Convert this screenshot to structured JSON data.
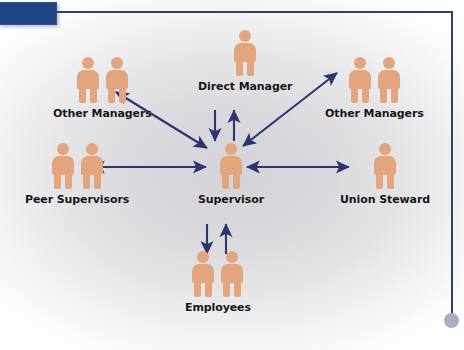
{
  "slide": {
    "title_accent_color": "#1f4585",
    "rule_color": "#2b4170",
    "dot_color": "#a9aec4",
    "figure_color": "#e3a57d",
    "arrow_color": "#2b3570",
    "background_center": "#d4d4d8",
    "background_edge": "#ffffff"
  },
  "diagram": {
    "type": "hub-and-spoke communication network",
    "center_node": "supervisor",
    "nodes": [
      {
        "id": "direct-manager",
        "label": "Direct Manager",
        "figure_count": 1,
        "position": "top-center"
      },
      {
        "id": "other-managers-left",
        "label": "Other Managers",
        "figure_count": 2,
        "position": "top-left"
      },
      {
        "id": "other-managers-right",
        "label": "Other Managers",
        "figure_count": 2,
        "position": "top-right"
      },
      {
        "id": "peer-supervisors",
        "label": "Peer Supervisors",
        "figure_count": 2,
        "position": "middle-left"
      },
      {
        "id": "supervisor",
        "label": "Supervisor",
        "figure_count": 1,
        "position": "center"
      },
      {
        "id": "union-steward",
        "label": "Union Steward",
        "figure_count": 1,
        "position": "middle-right"
      },
      {
        "id": "employees",
        "label": "Employees",
        "figure_count": 2,
        "position": "bottom-center"
      }
    ],
    "connections": [
      {
        "from": "supervisor",
        "to": "direct-manager",
        "style": "bidirectional",
        "orientation": "vertical"
      },
      {
        "from": "supervisor",
        "to": "other-managers-left",
        "style": "bidirectional",
        "orientation": "diagonal"
      },
      {
        "from": "supervisor",
        "to": "other-managers-right",
        "style": "bidirectional",
        "orientation": "diagonal"
      },
      {
        "from": "supervisor",
        "to": "peer-supervisors",
        "style": "bidirectional",
        "orientation": "horizontal"
      },
      {
        "from": "supervisor",
        "to": "union-steward",
        "style": "bidirectional",
        "orientation": "horizontal"
      },
      {
        "from": "supervisor",
        "to": "employees",
        "style": "bidirectional",
        "orientation": "vertical"
      }
    ]
  }
}
